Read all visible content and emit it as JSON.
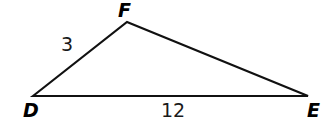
{
  "figure": {
    "kind": "triangle-diagram",
    "background_color": "#ffffff",
    "stroke_color": "#111111",
    "text_color": "#000000",
    "stroke_width": 2.2,
    "width": 321,
    "height": 126,
    "vertices": [
      {
        "id": "D",
        "label": "D",
        "x": 33,
        "y": 96
      },
      {
        "id": "F",
        "label": "F",
        "x": 127,
        "y": 22
      },
      {
        "id": "E",
        "label": "E",
        "x": 308,
        "y": 96
      }
    ],
    "edges": [
      {
        "id": "DF",
        "from": "D",
        "to": "F",
        "label": "3"
      },
      {
        "id": "FE",
        "from": "F",
        "to": "E",
        "label": ""
      },
      {
        "id": "DE",
        "from": "D",
        "to": "E",
        "label": "12"
      }
    ],
    "labels": {
      "vertex_F": "F",
      "vertex_D": "D",
      "vertex_E": "E",
      "side_DF": "3",
      "side_DE": "12"
    },
    "path_d": "M 33 96 L 127 22 L 308 96 Z"
  }
}
